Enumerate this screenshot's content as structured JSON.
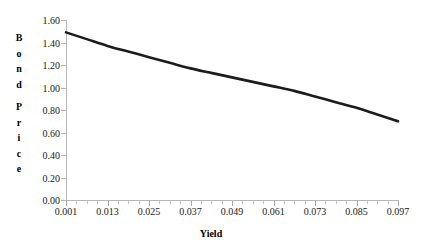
{
  "chart_data": {
    "type": "line",
    "title": "",
    "xlabel": "Yield",
    "ylabel": "Bond Price",
    "ylabel_letters": [
      "B",
      "o",
      "n",
      "d",
      "",
      "P",
      "r",
      "i",
      "c",
      "e"
    ],
    "grid": false,
    "legend": false,
    "legend_position": "none",
    "xlim": [
      0.001,
      0.097
    ],
    "ylim": [
      0.0,
      1.6
    ],
    "xticks": [
      0.001,
      0.013,
      0.025,
      0.037,
      0.049,
      0.061,
      0.073,
      0.085,
      0.097
    ],
    "xtick_labels": [
      "0.001",
      "0.013",
      "0.025",
      "0.037",
      "0.049",
      "0.061",
      "0.073",
      "0.085",
      "0.097"
    ],
    "xtick_minor_per_interval": 3,
    "yticks": [
      0.0,
      0.2,
      0.4,
      0.6,
      0.8,
      1.0,
      1.2,
      1.4,
      1.6
    ],
    "ytick_labels": [
      "0.00",
      "0.20",
      "0.40",
      "0.60",
      "0.80",
      "1.00",
      "1.20",
      "1.40",
      "1.60"
    ],
    "series": [
      {
        "name": "Bond Price",
        "color": "#1c1c1c",
        "line_width": 2.6,
        "x": [
          0.001,
          0.007,
          0.013,
          0.019,
          0.025,
          0.031,
          0.037,
          0.043,
          0.049,
          0.055,
          0.061,
          0.067,
          0.073,
          0.079,
          0.085,
          0.091,
          0.097
        ],
        "values": [
          1.49,
          1.43,
          1.37,
          1.32,
          1.27,
          1.22,
          1.17,
          1.13,
          1.09,
          1.05,
          1.01,
          0.97,
          0.92,
          0.87,
          0.82,
          0.76,
          0.7
        ]
      }
    ]
  },
  "axis_colors": {
    "axis_line": "#b6b6b6",
    "tick_label": "#1a1a1a",
    "title": "#000000",
    "background": "#ffffff"
  }
}
